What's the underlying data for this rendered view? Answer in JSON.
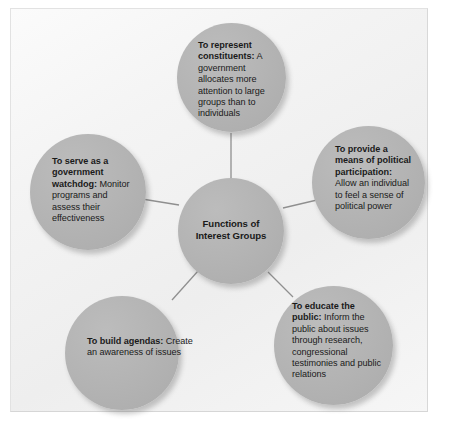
{
  "diagram": {
    "title": "Functions of Interest Groups",
    "type": "hub-and-spoke",
    "colors": {
      "node_fill": "#b4b4b4",
      "node_text": "#1a1a1a",
      "connector": "#8c8c8c",
      "panel_background": "#f2f2f2",
      "page_background": "#ffffff"
    },
    "center": {
      "label": "Functions of Interest Groups",
      "line1": "Functions of",
      "line2": "Interest Groups"
    },
    "nodes": [
      {
        "id": "represent",
        "position": "top",
        "lead": "To represent constituents:",
        "body": "A government allocates more attention to large groups than to individuals"
      },
      {
        "id": "participation",
        "position": "right",
        "lead": "To provide a means of political participation:",
        "body": "Allow an individual to feel a sense of political power"
      },
      {
        "id": "watchdog",
        "position": "left",
        "lead": "To serve as a government watchdog:",
        "body": "Monitor programs and assess their effectiveness"
      },
      {
        "id": "educate",
        "position": "bottom-right",
        "lead": "To educate the public:",
        "body": "Inform the public about issues through research, congressional testimonies and public relations"
      },
      {
        "id": "agendas",
        "position": "bottom-left",
        "lead": "To build agendas:",
        "body": "Create an awareness of issues"
      }
    ]
  }
}
